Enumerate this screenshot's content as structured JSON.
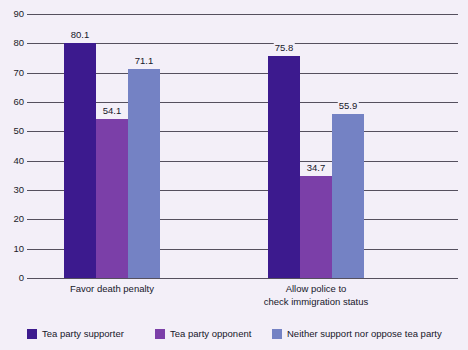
{
  "chart_data": {
    "type": "bar",
    "title": "",
    "subtitle": "",
    "xlabel": "",
    "ylabel": "",
    "ylim": [
      0,
      90
    ],
    "ytick_step": 10,
    "yticks": [
      "90",
      "80",
      "70",
      "60",
      "50",
      "40",
      "30",
      "20",
      "10",
      "0"
    ],
    "grid": true,
    "legend_position": "bottom",
    "categories": [
      "Favor death penalty",
      "Allow police to\ncheck immigration status"
    ],
    "series": [
      {
        "name": "Tea party supporter",
        "color": "#3c1a8e",
        "values": [
          80.1,
          75.8
        ],
        "labels": [
          "80.1",
          "75.8"
        ]
      },
      {
        "name": "Tea party opponent",
        "color": "#7b3fa8",
        "values": [
          54.1,
          34.7
        ],
        "labels": [
          "54.1",
          "34.7"
        ]
      },
      {
        "name": "Neither support nor oppose tea party",
        "color": "#7482c4",
        "values": [
          71.1,
          55.9
        ],
        "labels": [
          "71.1",
          "55.9"
        ]
      }
    ]
  },
  "colors": {
    "background": "#f3eff8",
    "gridline": "#55505e",
    "text": "#17172a",
    "series_1": "#3c1a8e",
    "series_2": "#7b3fa8",
    "series_3": "#7482c4"
  },
  "legend": {
    "items": [
      {
        "label": "Tea party supporter",
        "color": "#3c1a8e"
      },
      {
        "label": "Tea party opponent",
        "color": "#7b3fa8"
      },
      {
        "label": "Neither support nor oppose tea party",
        "color": "#7482c4"
      }
    ]
  }
}
